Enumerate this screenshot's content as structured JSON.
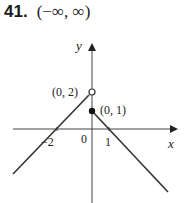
{
  "problem": {
    "number": "41.",
    "answer": "(−∞, ∞)"
  },
  "graph": {
    "axes": {
      "x_label": "x",
      "y_label": "y",
      "origin_label": "0"
    },
    "tick_labels": {
      "neg_two": "−2",
      "one": "1"
    },
    "points": {
      "open": {
        "label": "(0, 2)",
        "x": 0,
        "y": 2,
        "filled": false
      },
      "closed": {
        "label": "(0, 1)",
        "x": 0,
        "y": 1,
        "filled": true
      }
    },
    "pieces": [
      {
        "name": "left",
        "formula": "y = x + 2",
        "domain": "x < 0",
        "endpoint": "open at (0, 2)"
      },
      {
        "name": "right",
        "formula": "y = 1 − x",
        "domain": "x ≥ 0",
        "endpoint": "closed at (0, 1)"
      }
    ],
    "colors": {
      "stroke": "#333333",
      "background": "#ffffff"
    }
  }
}
